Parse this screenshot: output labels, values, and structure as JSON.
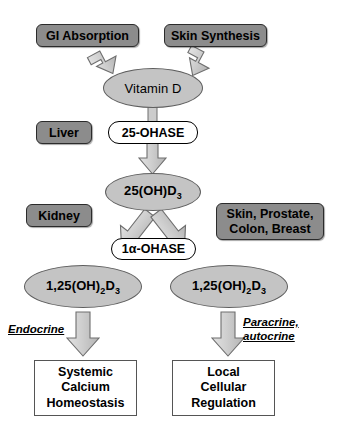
{
  "diagram": {
    "colors": {
      "source_box_fill": "#8c8c8c",
      "source_box_border": "#2b2b2b",
      "ellipse_fill": "#c4c4c4",
      "ellipse_border": "#5e5e5e",
      "enzyme_pill_fill": "#ffffff",
      "enzyme_pill_border": "#000000",
      "outcome_box_fill": "#ffffff",
      "outcome_box_border": "#555555",
      "arrow_fill": "#c9c9c9",
      "arrow_border": "#6b6b6b",
      "text": "#000000",
      "background": "#ffffff"
    },
    "sources": [
      {
        "name": "gi-absorption",
        "label": "GI Absorption"
      },
      {
        "name": "skin-synthesis",
        "label": "Skin Synthesis"
      }
    ],
    "tissues": [
      {
        "name": "liver",
        "label": "Liver"
      },
      {
        "name": "kidney",
        "label": "Kidney"
      },
      {
        "name": "extrarenal",
        "line1": "Skin, Prostate,",
        "line2": "Colon, Breast"
      }
    ],
    "metabolites": [
      {
        "name": "vitamin-d",
        "label": "Vitamin D"
      },
      {
        "name": "25-oh-d3",
        "prefix": "25(OH)D",
        "sub": "3"
      },
      {
        "name": "calcitriol-renal",
        "prefix": "1,25(OH)",
        "sub1": "2",
        "mid": "D",
        "sub2": "3"
      },
      {
        "name": "calcitriol-extrarenal",
        "prefix": "1,25(OH)",
        "sub1": "2",
        "mid": "D",
        "sub2": "3"
      }
    ],
    "enzymes": [
      {
        "name": "25-ohase",
        "label": "25-OHASE"
      },
      {
        "name": "1a-ohase",
        "label": "1α-OHASE"
      }
    ],
    "signalling": [
      {
        "name": "endocrine",
        "label": "Endocrine"
      },
      {
        "name": "paracrine-autocrine",
        "line1": "Paracrine,",
        "line2": "autocrine"
      }
    ],
    "outcomes": [
      {
        "name": "systemic-calcium-homeostasis",
        "line1": "Systemic",
        "line2": "Calcium",
        "line3": "Homeostasis"
      },
      {
        "name": "local-cellular-regulation",
        "line1": "Local",
        "line2": "Cellular",
        "line3": "Regulation"
      }
    ],
    "arrows": [
      {
        "name": "arrow-gi-to-vitamind",
        "direction": "down-right"
      },
      {
        "name": "arrow-skin-to-vitamind",
        "direction": "down-left"
      },
      {
        "name": "arrow-vitamind-to-25ohd3",
        "direction": "down"
      },
      {
        "name": "arrow-25ohd3-to-renal-calcitriol",
        "direction": "down-left"
      },
      {
        "name": "arrow-25ohd3-to-extrarenal-calcitriol",
        "direction": "down-right"
      },
      {
        "name": "arrow-renal-calcitriol-to-systemic",
        "direction": "down"
      },
      {
        "name": "arrow-extrarenal-calcitriol-to-local",
        "direction": "down"
      }
    ]
  }
}
